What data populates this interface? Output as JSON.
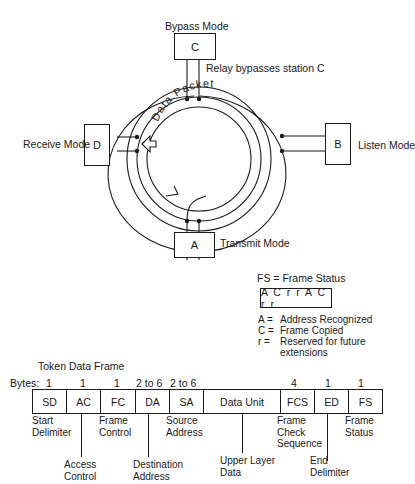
{
  "ring": {
    "stations": [
      {
        "id": "C",
        "letter": "C",
        "mode": "Bypass Mode"
      },
      {
        "id": "B",
        "letter": "B",
        "mode": "Listen Mode"
      },
      {
        "id": "A",
        "letter": "A",
        "mode": "Transmit Mode"
      },
      {
        "id": "D",
        "letter": "D",
        "mode": "Receive Mode"
      }
    ],
    "relay_note": "Relay bypasses station C",
    "packet_label": "Data Packet"
  },
  "frame_status": {
    "title": "FS = Frame Status",
    "bits": "A C r r A C r r",
    "legend": [
      {
        "key": "A =",
        "value": "Address Recognized"
      },
      {
        "key": "C =",
        "value": "Frame Copied"
      },
      {
        "key": "r  =",
        "value": "Reserved for future"
      },
      {
        "key": "",
        "value": "extensions"
      }
    ]
  },
  "token_frame": {
    "title": "Token Data Frame",
    "bytes_label": "Bytes:",
    "fields": [
      {
        "abbr": "SD",
        "bytes": "1",
        "desc": [
          "Start",
          "Delimiter"
        ]
      },
      {
        "abbr": "AC",
        "bytes": "1",
        "desc": [
          "Access",
          "Control"
        ]
      },
      {
        "abbr": "FC",
        "bytes": "1",
        "desc": [
          "Frame",
          "Control"
        ]
      },
      {
        "abbr": "DA",
        "bytes": "2 to 6",
        "desc": [
          "Destination",
          "Address"
        ]
      },
      {
        "abbr": "SA",
        "bytes": "2 to 6",
        "desc": [
          "Source",
          "Address"
        ]
      },
      {
        "abbr": "Data Unit",
        "bytes": "",
        "desc": [
          "Upper Layer",
          "Data"
        ]
      },
      {
        "abbr": "FCS",
        "bytes": "4",
        "desc": [
          "Frame",
          "Check",
          "Sequence"
        ]
      },
      {
        "abbr": "ED",
        "bytes": "1",
        "desc": [
          "End",
          "Delimiter"
        ]
      },
      {
        "abbr": "FS",
        "bytes": "1",
        "desc": [
          "Frame",
          "Status"
        ]
      }
    ]
  }
}
